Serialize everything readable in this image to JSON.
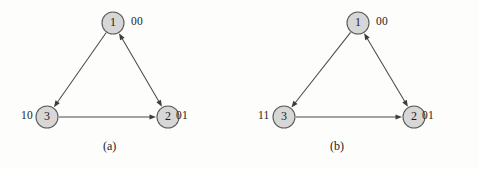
{
  "figure": {
    "background_color": "#fdfdfc",
    "node_fill_color": "#d7d7d7",
    "node_stroke_color": "#5a5a5a",
    "edge_color": "#4a4a4a",
    "text_color": "#1b1b1b"
  },
  "panels": [
    {
      "caption": "(a)",
      "nodes": [
        {
          "id": "1",
          "label": "1",
          "code": "00",
          "cx": 113,
          "cy": 23,
          "r": 11
        },
        {
          "id": "3",
          "label": "3",
          "code": "10",
          "cx": 47,
          "cy": 117,
          "r": 11
        },
        {
          "id": "2",
          "label": "2",
          "code": "01",
          "cx": 168,
          "cy": 117,
          "r": 11
        }
      ],
      "edges": [
        {
          "from": "1",
          "to": "3",
          "arrow_at_from": false,
          "arrow_at_to": true
        },
        {
          "from": "3",
          "to": "2",
          "arrow_at_from": false,
          "arrow_at_to": true
        },
        {
          "from": "1",
          "to": "2",
          "arrow_at_from": true,
          "arrow_at_to": true
        }
      ]
    },
    {
      "caption": "(b)",
      "nodes": [
        {
          "id": "1",
          "label": "1",
          "code": "00",
          "cx": 118,
          "cy": 23,
          "r": 11
        },
        {
          "id": "3",
          "label": "3",
          "code": "11",
          "cx": 44,
          "cy": 117,
          "r": 11
        },
        {
          "id": "2",
          "label": "2",
          "code": "01",
          "cx": 174,
          "cy": 117,
          "r": 11
        }
      ],
      "edges": [
        {
          "from": "1",
          "to": "3",
          "arrow_at_from": false,
          "arrow_at_to": true
        },
        {
          "from": "3",
          "to": "2",
          "arrow_at_from": false,
          "arrow_at_to": true
        },
        {
          "from": "1",
          "to": "2",
          "arrow_at_from": true,
          "arrow_at_to": true
        }
      ]
    }
  ]
}
